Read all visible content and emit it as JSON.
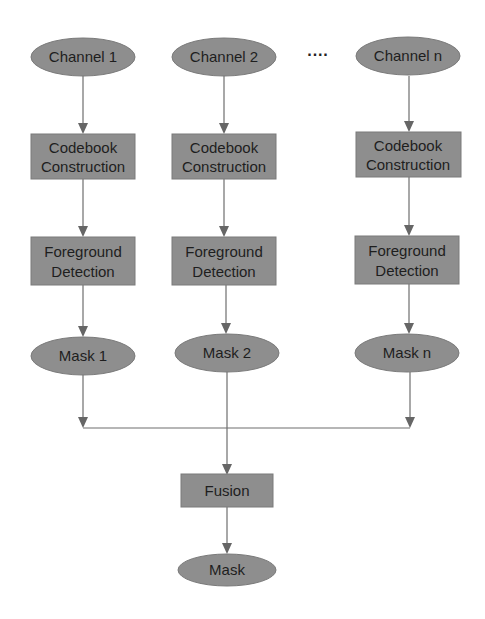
{
  "diagram": {
    "colors": {
      "node_fill": "#8e8e8e",
      "text": "#1e1e1e",
      "edge": "#6e6e6e",
      "background": "#ffffff"
    },
    "ellipsis": "····",
    "columns": [
      {
        "channel": "Channel 1",
        "codebook": [
          "Codebook",
          "Construction"
        ],
        "foreground": [
          "Foreground",
          "Detection"
        ],
        "mask": "Mask 1"
      },
      {
        "channel": "Channel 2",
        "codebook": [
          "Codebook",
          "Construction"
        ],
        "foreground": [
          "Foreground",
          "Detection"
        ],
        "mask": "Mask 2"
      },
      {
        "channel": "Channel n",
        "codebook": [
          "Codebook",
          "Construction"
        ],
        "foreground": [
          "Foreground",
          "Detection"
        ],
        "mask": "Mask n"
      }
    ],
    "fusion": "Fusion",
    "output": "Mask"
  }
}
